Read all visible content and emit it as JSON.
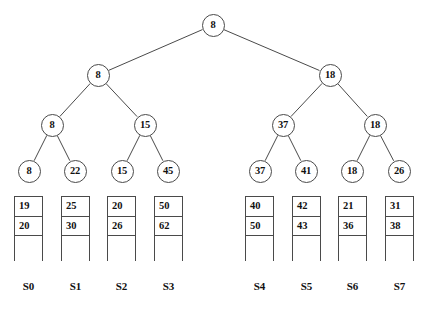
{
  "diagram": {
    "type": "b-tree-index-with-buckets",
    "title": "",
    "colors": {
      "background": "#ffffff",
      "stroke": "#4a4a4a",
      "text": "#111111"
    },
    "tree": {
      "levels": [
        {
          "level": 0,
          "name": "root",
          "nodes": [
            {
              "id": "n0",
              "label": "8",
              "x": 213,
              "y": 25
            }
          ]
        },
        {
          "level": 1,
          "name": "internal-level-1",
          "nodes": [
            {
              "id": "n1",
              "label": "8",
              "x": 98,
              "y": 75
            },
            {
              "id": "n2",
              "label": "18",
              "x": 330,
              "y": 75
            }
          ]
        },
        {
          "level": 2,
          "name": "internal-level-2",
          "nodes": [
            {
              "id": "n3",
              "label": "8",
              "x": 52,
              "y": 125
            },
            {
              "id": "n4",
              "label": "15",
              "x": 145,
              "y": 125
            },
            {
              "id": "n5",
              "label": "37",
              "x": 283,
              "y": 125
            },
            {
              "id": "n6",
              "label": "18",
              "x": 375,
              "y": 125
            }
          ]
        },
        {
          "level": 3,
          "name": "leaf-level",
          "nodes": [
            {
              "id": "n7",
              "label": "8",
              "x": 29,
              "y": 171
            },
            {
              "id": "n8",
              "label": "22",
              "x": 75,
              "y": 171
            },
            {
              "id": "n9",
              "label": "15",
              "x": 122,
              "y": 171
            },
            {
              "id": "n10",
              "label": "45",
              "x": 168,
              "y": 171
            },
            {
              "id": "n11",
              "label": "37",
              "x": 260,
              "y": 171
            },
            {
              "id": "n12",
              "label": "41",
              "x": 306,
              "y": 171
            },
            {
              "id": "n13",
              "label": "18",
              "x": 352,
              "y": 171
            },
            {
              "id": "n14",
              "label": "26",
              "x": 399,
              "y": 171
            }
          ]
        }
      ],
      "edges": [
        {
          "from": "n0",
          "to": "n1"
        },
        {
          "from": "n0",
          "to": "n2"
        },
        {
          "from": "n1",
          "to": "n3"
        },
        {
          "from": "n1",
          "to": "n4"
        },
        {
          "from": "n2",
          "to": "n5"
        },
        {
          "from": "n2",
          "to": "n6"
        },
        {
          "from": "n3",
          "to": "n7"
        },
        {
          "from": "n3",
          "to": "n8"
        },
        {
          "from": "n4",
          "to": "n9"
        },
        {
          "from": "n4",
          "to": "n10"
        },
        {
          "from": "n5",
          "to": "n11"
        },
        {
          "from": "n5",
          "to": "n12"
        },
        {
          "from": "n6",
          "to": "n13"
        },
        {
          "from": "n6",
          "to": "n14"
        }
      ]
    },
    "buckets": [
      {
        "id": "b0",
        "label": "S0",
        "x": 14,
        "values": [
          "19",
          "20"
        ]
      },
      {
        "id": "b1",
        "label": "S1",
        "x": 61,
        "values": [
          "25",
          "30"
        ]
      },
      {
        "id": "b2",
        "label": "S2",
        "x": 107,
        "values": [
          "20",
          "26"
        ]
      },
      {
        "id": "b3",
        "label": "S3",
        "x": 154,
        "values": [
          "50",
          "62"
        ]
      },
      {
        "id": "b4",
        "label": "S4",
        "x": 245,
        "values": [
          "40",
          "50"
        ]
      },
      {
        "id": "b5",
        "label": "S5",
        "x": 292,
        "values": [
          "42",
          "43"
        ]
      },
      {
        "id": "b6",
        "label": "S6",
        "x": 338,
        "values": [
          "21",
          "36"
        ]
      },
      {
        "id": "b7",
        "label": "S7",
        "x": 385,
        "values": [
          "31",
          "38"
        ]
      }
    ],
    "bucket_geometry": {
      "top": 196,
      "cell_height": 20,
      "tail_height": 25,
      "width": 29,
      "label_y": 281
    }
  }
}
